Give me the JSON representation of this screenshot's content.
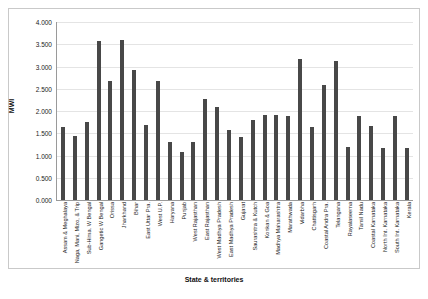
{
  "chart_data": {
    "type": "bar",
    "title": "",
    "xlabel": "State & territories",
    "ylabel": "MWI",
    "ylim": [
      0,
      4.0
    ],
    "ytick_labels": [
      "4.000",
      "3.500",
      "3.000",
      "2.500",
      "2.000",
      "1.500",
      "1.000",
      "0.500",
      "0.000"
    ],
    "ytick_values": [
      4.0,
      3.5,
      3.0,
      2.5,
      2.0,
      1.5,
      1.0,
      0.5,
      0.0
    ],
    "grid": true,
    "legend": "none",
    "bar_color": "#484848",
    "categories": [
      "Assam & Meghalaya",
      "Naga, Mani, Mizo, & Trip",
      "Sub-Hima. W Bengal",
      "Gangetic W Bengal",
      "Orissa",
      "Jharkhand",
      "Bihar",
      "East Uttar Pra.",
      "West U.P.",
      "Haryana",
      "Punjab",
      "West Rajasthan",
      "East Rajasthan",
      "West Madhya Pradesh",
      "East Madhya Pradesh",
      "Gujarat",
      "Saurashtra & Kutch",
      "Konkan & Goa",
      "Madhya Maharashtra",
      "Marathwada",
      "Vidarbha",
      "Chattisgarh",
      "Coastal Andra Pra.",
      "Telangana",
      "Rayalaseema",
      "Tamil Nadu",
      "Coastal Karnataka",
      "North Int. Karnataka",
      "South Int. Karnataka",
      "Kerala"
    ],
    "values": [
      1.64,
      1.44,
      1.75,
      3.58,
      2.67,
      3.59,
      2.92,
      1.68,
      2.68,
      1.3,
      1.08,
      1.3,
      2.28,
      2.08,
      1.58,
      1.42,
      1.8,
      1.9,
      1.92,
      1.88,
      3.18,
      1.64,
      2.58,
      3.12,
      1.2,
      1.88,
      1.66,
      1.18,
      1.88,
      1.18
    ]
  }
}
